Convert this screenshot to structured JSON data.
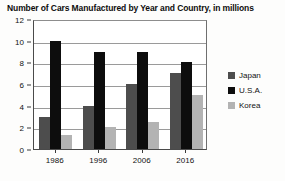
{
  "chart_data": {
    "type": "bar",
    "title": "Number of Cars Manufactured by Year and Country, in millions",
    "xlabel": "",
    "ylabel": "",
    "categories": [
      "1986",
      "1996",
      "2006",
      "2016"
    ],
    "series": [
      {
        "name": "Japan",
        "color": "#4d4d4d",
        "values": [
          3,
          4,
          6,
          7
        ]
      },
      {
        "name": "U.S.A.",
        "color": "#0d0d0d",
        "values": [
          10,
          9,
          9,
          8
        ]
      },
      {
        "name": "Korea",
        "color": "#b3b3b3",
        "values": [
          1.3,
          2,
          2.5,
          5
        ]
      }
    ],
    "ylim": [
      0,
      12
    ],
    "yticks": [
      0,
      2,
      4,
      6,
      8,
      10,
      12
    ],
    "ytick_labels": [
      "0",
      "2",
      "4",
      "6",
      "8",
      "10",
      "12"
    ],
    "grid": true,
    "grid_axis": "y",
    "legend_position": "right",
    "background": "#ffffff"
  }
}
